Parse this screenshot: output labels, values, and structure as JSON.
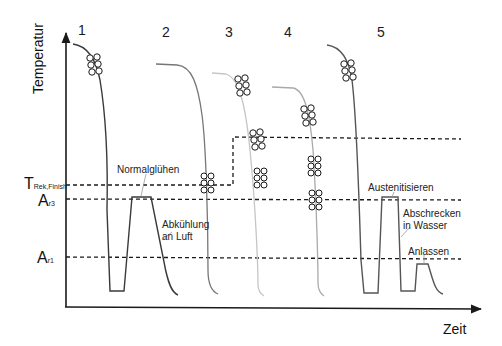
{
  "axes": {
    "y_label": "Temperatur",
    "x_label": "Zeit"
  },
  "levels": [
    {
      "id": "t_rek_finish",
      "main": "T",
      "sub": "Rek,Finish"
    },
    {
      "id": "a_r3",
      "main": "A",
      "sub": "r3"
    },
    {
      "id": "a_r1",
      "main": "A",
      "sub": "r1"
    }
  ],
  "curves": [
    {
      "number": "1"
    },
    {
      "number": "2"
    },
    {
      "number": "3"
    },
    {
      "number": "4"
    },
    {
      "number": "5"
    }
  ],
  "annotations": {
    "normalgluehen": "Normalglühen",
    "abkuehlung_line1": "Abkühlung",
    "abkuehlung_line2": "an Luft",
    "austenitisieren": "Austenitisieren",
    "abschrecken_line1": "Abschrecken",
    "abschrecken_line2": "in Wasser",
    "anlassen": "Anlassen"
  },
  "colors": {
    "axis": "#1a1a1a",
    "curve_dark": "#555555",
    "curve_mid": "#8a8a8a",
    "curve_light": "#c4c4c4",
    "dash": "#1a1a1a"
  }
}
